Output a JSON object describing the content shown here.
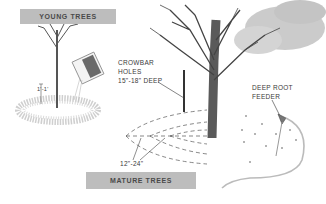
{
  "young_trees": {
    "banner": "YOUNG TREES",
    "dimension_label": "1'-1'",
    "box_label": "PHC"
  },
  "mature_trees": {
    "banner": "MATURE TREES",
    "crowbar_label_line1": "CROWBAR",
    "crowbar_label_line2": "HOLES",
    "crowbar_label_line3": "15\"-18\" DEEP",
    "spacing_label": "12\"-24\"",
    "feeder_label_line1": "DEEP ROOT",
    "feeder_label_line2": "FEEDER"
  },
  "colors": {
    "banner": "#bdbdbd",
    "ink": "#3a3a3a",
    "foliage": "#c8c8c8",
    "mulch": "#d4d4d4"
  }
}
